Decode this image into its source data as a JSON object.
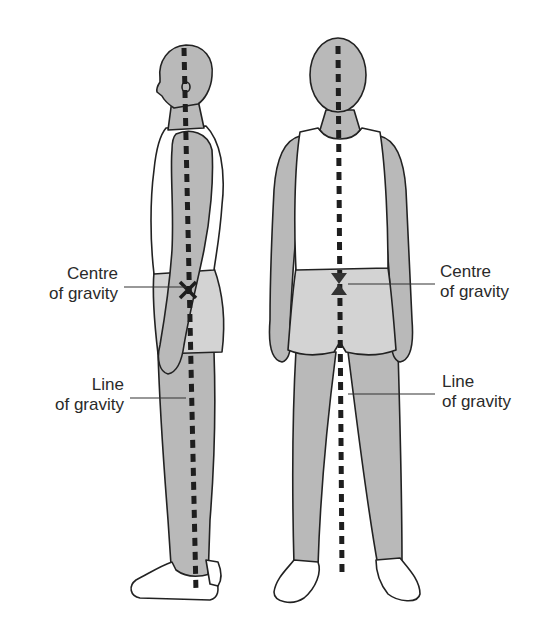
{
  "diagram": {
    "figures": [
      {
        "id": "side-view",
        "description": "Side view of standing person"
      },
      {
        "id": "front-view",
        "description": "Front view of standing person"
      }
    ],
    "labels": {
      "side_centre_line1": "Centre",
      "side_centre_line2": "of gravity",
      "side_line_line1": "Line",
      "side_line_line2": "of gravity",
      "front_centre_line1": "Centre",
      "front_centre_line2": "of gravity",
      "front_line_line1": "Line",
      "front_line_line2": "of gravity"
    },
    "markers": {
      "centre_of_gravity_symbol": "X",
      "line_of_gravity_style": "dashed-vertical"
    },
    "colors": {
      "skin": "#b9b9b9",
      "shorts": "#d3d3d3",
      "vest": "#ffffff",
      "outline": "#222222",
      "dash": "#1e1e1e",
      "leader": "#333333"
    }
  }
}
